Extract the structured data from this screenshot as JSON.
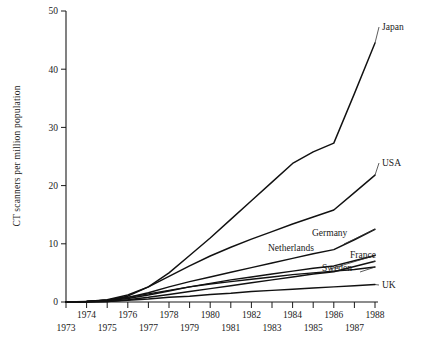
{
  "chart_data": {
    "type": "line",
    "title": "",
    "xlabel": "",
    "ylabel": "CT scanners per million population",
    "xlim": [
      1973,
      1988
    ],
    "ylim": [
      0,
      50
    ],
    "grid": false,
    "legend_position": "right-inline-labels",
    "x": [
      1973,
      1974,
      1975,
      1976,
      1977,
      1978,
      1979,
      1980,
      1981,
      1982,
      1983,
      1984,
      1985,
      1986,
      1987,
      1988
    ],
    "y_ticks": [
      0,
      10,
      20,
      30,
      40,
      50
    ],
    "x_ticks_upper": [
      1974,
      1976,
      1978,
      1980,
      1982,
      1984,
      1986,
      1988
    ],
    "x_ticks_lower": [
      1973,
      1975,
      1977,
      1979,
      1981,
      1983,
      1985,
      1987
    ],
    "series": [
      {
        "name": "Japan",
        "label": "Japan",
        "values": [
          0,
          0.1,
          0.3,
          1.0,
          2.6,
          5.0,
          8.0,
          11.0,
          14.2,
          17.4,
          20.6,
          23.8,
          25.8,
          27.3,
          35.8,
          44.5
        ]
      },
      {
        "name": "USA",
        "label": "USA",
        "values": [
          0,
          0.1,
          0.4,
          1.2,
          2.6,
          4.4,
          6.2,
          7.9,
          9.4,
          10.8,
          12.1,
          13.4,
          14.6,
          15.8,
          18.8,
          21.8
        ]
      },
      {
        "name": "Germany",
        "label": "Germany",
        "values": [
          0,
          0.1,
          0.3,
          0.8,
          1.6,
          2.6,
          3.5,
          4.3,
          5.1,
          5.9,
          6.7,
          7.5,
          8.3,
          9.0,
          10.7,
          12.5
        ]
      },
      {
        "name": "Netherlands",
        "label": "Netherlands",
        "values": [
          0,
          0.1,
          0.2,
          0.6,
          1.2,
          1.9,
          2.6,
          3.2,
          3.8,
          4.3,
          4.8,
          5.3,
          5.8,
          6.2,
          7.1,
          8.0
        ]
      },
      {
        "name": "France",
        "label": "France",
        "values": [
          0,
          0.0,
          0.1,
          0.4,
          0.8,
          1.3,
          1.8,
          2.3,
          2.8,
          3.3,
          3.8,
          4.3,
          4.8,
          5.2,
          6.1,
          7.0
        ]
      },
      {
        "name": "Sweden",
        "label": "Sweden",
        "values": [
          0,
          0.1,
          0.3,
          0.8,
          1.4,
          2.0,
          2.6,
          3.1,
          3.5,
          3.9,
          4.3,
          4.7,
          5.0,
          5.3,
          5.6,
          6.0
        ]
      },
      {
        "name": "UK",
        "label": "UK",
        "values": [
          0,
          0.0,
          0.1,
          0.3,
          0.5,
          0.8,
          1.0,
          1.3,
          1.5,
          1.8,
          2.0,
          2.2,
          2.4,
          2.6,
          2.8,
          3.0
        ]
      }
    ]
  }
}
